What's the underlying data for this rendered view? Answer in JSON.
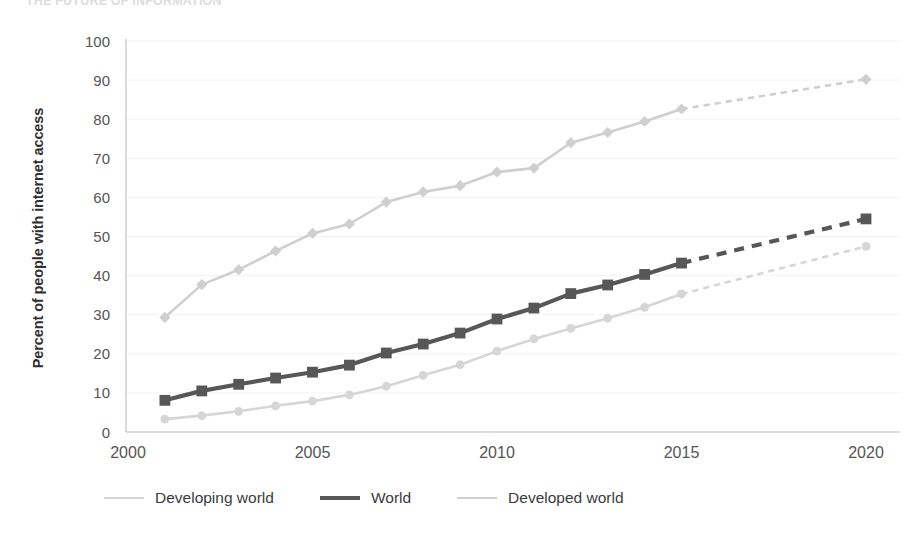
{
  "chart_data": {
    "type": "line",
    "title": "THE FUTURE OF INFORMATION",
    "xlabel": "",
    "ylabel": "Percent of people with internet access",
    "xlim": [
      2000,
      2020
    ],
    "ylim": [
      0,
      100
    ],
    "y_ticks": [
      0,
      10,
      20,
      30,
      40,
      50,
      60,
      70,
      80,
      90,
      100
    ],
    "x_ticks": [
      2000,
      2005,
      2010,
      2015,
      2020
    ],
    "grid": true,
    "legend_position": "bottom",
    "series": [
      {
        "name": "Developed world",
        "color": "#cfcfcf",
        "marker": "diamond",
        "line_width": 2.6,
        "x": [
          2001,
          2002,
          2003,
          2004,
          2005,
          2006,
          2007,
          2008,
          2009,
          2010,
          2011,
          2012,
          2013,
          2014,
          2015,
          2020
        ],
        "values": [
          29.3,
          37.7,
          41.5,
          46.3,
          50.8,
          53.2,
          58.8,
          61.4,
          63.0,
          66.5,
          67.5,
          74.0,
          76.6,
          79.4,
          82.6,
          90.2
        ],
        "dashed_from": 2015
      },
      {
        "name": "World",
        "color": "#575757",
        "marker": "square",
        "line_width": 4.2,
        "x": [
          2001,
          2002,
          2003,
          2004,
          2005,
          2006,
          2007,
          2008,
          2009,
          2010,
          2011,
          2012,
          2013,
          2014,
          2015,
          2020
        ],
        "values": [
          8.1,
          10.5,
          12.2,
          13.8,
          15.3,
          17.1,
          20.2,
          22.5,
          25.3,
          28.9,
          31.7,
          35.4,
          37.6,
          40.3,
          43.2,
          54.5
        ],
        "dashed_from": 2015
      },
      {
        "name": "Developing world",
        "color": "#d6d6d6",
        "marker": "circle",
        "line_width": 2.6,
        "x": [
          2001,
          2002,
          2003,
          2004,
          2005,
          2006,
          2007,
          2008,
          2009,
          2010,
          2011,
          2012,
          2013,
          2014,
          2015,
          2020
        ],
        "values": [
          3.3,
          4.2,
          5.3,
          6.7,
          7.9,
          9.5,
          11.7,
          14.5,
          17.2,
          20.7,
          23.8,
          26.5,
          29.1,
          31.9,
          35.3,
          47.5
        ],
        "dashed_from": 2015
      }
    ],
    "legend_order": [
      "Developing world",
      "World",
      "Developed world"
    ]
  }
}
